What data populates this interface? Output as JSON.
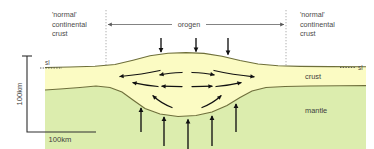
{
  "figure": {
    "width": 374,
    "height": 149
  },
  "labels": {
    "left_crust_line1": "'normal'",
    "left_crust_line2": "continental",
    "left_crust_line3": "crust",
    "right_crust_line1": "'normal'",
    "right_crust_line2": "continental",
    "right_crust_line3": "crust",
    "orogen": "orogen",
    "sea_level_left": "sl",
    "sea_level_right": "sl",
    "crust": "crust",
    "mantle": "mantle",
    "scale_vertical": "100km",
    "scale_horizontal": "100km"
  },
  "colors": {
    "crust_fill": "#fbfbc3",
    "mantle_fill": "#dcedae",
    "horizon_stroke": "#6e6f3a",
    "arrow": "#111111",
    "text": "#4a4a4a",
    "guide": "#8d8d8d",
    "background": "#ffffff"
  },
  "annotations": {
    "load_arrows_top_count": 3,
    "uplift_arrows_bottom_count": 5,
    "flow_arrows_count": 12,
    "flow_direction": "divergent outward from orogen core"
  }
}
